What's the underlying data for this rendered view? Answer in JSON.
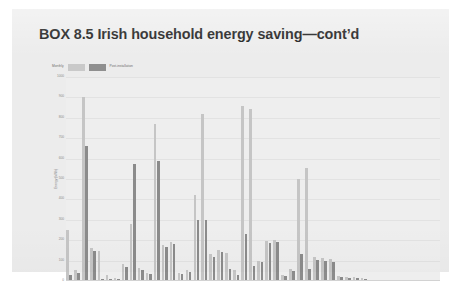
{
  "box": {
    "title": "BOX 8.5 Irish household energy saving—cont’d"
  },
  "chart_data": {
    "type": "bar",
    "title": "",
    "subtitle": "",
    "xlabel": "",
    "ylabel": "Energy (kWh)",
    "ylim": [
      0,
      1000
    ],
    "yticks": [
      0,
      100,
      200,
      300,
      400,
      500,
      600,
      700,
      800,
      900,
      1000
    ],
    "ytick_labels": [
      "0",
      "100",
      "200",
      "300",
      "400",
      "500",
      "600",
      "700",
      "800",
      "900",
      "1000"
    ],
    "grid": true,
    "legend_position": "top-left",
    "categories": [
      "1",
      "2",
      "3",
      "4",
      "5",
      "6",
      "7",
      "8",
      "9",
      "10",
      "11",
      "12",
      "13",
      "14",
      "15",
      "16",
      "17",
      "18",
      "19",
      "20",
      "21",
      "22",
      "23",
      "24",
      "25",
      "26",
      "27",
      "28",
      "29",
      "30",
      "31",
      "32",
      "33",
      "34",
      "35",
      "36",
      "37",
      "38"
    ],
    "series": [
      {
        "name": "Monthly",
        "color": "#c5c5c5",
        "values": [
          250,
          55,
          900,
          160,
          145,
          30,
          15,
          85,
          280,
          65,
          40,
          770,
          175,
          190,
          40,
          55,
          420,
          820,
          130,
          150,
          135,
          55,
          860,
          845,
          100,
          195,
          200,
          30,
          60,
          500,
          555,
          120,
          115,
          110,
          25,
          20,
          18,
          15
        ]
      },
      {
        "name": "Post-installation",
        "color": "#8b8b8b",
        "values": [
          30,
          38,
          660,
          145,
          10,
          12,
          8,
          70,
          575,
          55,
          35,
          590,
          165,
          180,
          35,
          45,
          300,
          300,
          120,
          140,
          60,
          30,
          230,
          75,
          95,
          185,
          190,
          25,
          50,
          130,
          60,
          105,
          100,
          95,
          20,
          15,
          14,
          12
        ]
      }
    ]
  },
  "legend": {
    "items": [
      {
        "label": "Monthly"
      },
      {
        "label": "Post-installation"
      }
    ]
  }
}
